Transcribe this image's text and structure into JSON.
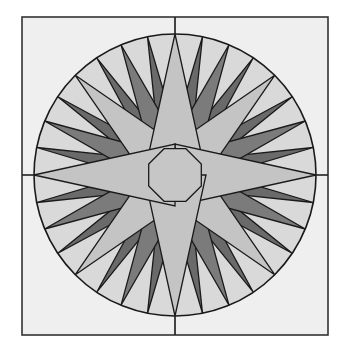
{
  "figure": {
    "title": "",
    "canvas": {
      "width": 345,
      "height": 354
    },
    "frame": {
      "x": 22,
      "y": 17,
      "width": 306,
      "height": 318
    },
    "center": {
      "x": 175,
      "y": 175
    },
    "circle_radius": 141,
    "colors": {
      "page": "#ffffff",
      "frame_fill": "#efefef",
      "circle_fill": "#d9d9d9",
      "light_point": "#c4c4c4",
      "center": "#c6c6c6",
      "medium_point": "#7b7b7b",
      "small_point": "#6a6a6a",
      "outline": "#1a1a1a"
    },
    "small_points": {
      "count": 16,
      "start_angle": 11.25,
      "step": 22.5,
      "tip_r": 141,
      "base_r": 66,
      "half_spread": 6
    },
    "medium_points": {
      "count": 8,
      "start_angle": 22.5,
      "step": 45,
      "tip_r": 141,
      "base_r": 52,
      "half_spread": 13,
      "inner_r": 31
    },
    "light_points": {
      "cardinal": {
        "angles": [
          0,
          90,
          180,
          270
        ],
        "tip_r": 141,
        "inner_r": 31,
        "inner_offset": 90
      },
      "diagonal": {
        "angles": [
          45,
          135,
          225,
          315
        ],
        "tip_r": 141,
        "inner_r": 31,
        "inner_offset": 45
      }
    },
    "center_octagon": {
      "r": 31,
      "sides": 8,
      "rotation": 0
    }
  }
}
